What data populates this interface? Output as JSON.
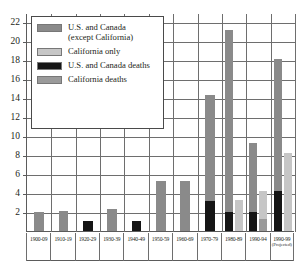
{
  "chart_data": {
    "type": "bar",
    "title": "",
    "subtitle": "",
    "xlabel": "",
    "ylabel": "",
    "ylim": [
      0,
      23
    ],
    "yticks": [
      2,
      4,
      6,
      8,
      10,
      12,
      14,
      16,
      18,
      20,
      22
    ],
    "grid": true,
    "legend_position": "upper-left",
    "categories": [
      "1900-09",
      "1910-19",
      "1920-29",
      "1930-39",
      "1940-49",
      "1950-59",
      "1960-69",
      "1970-79",
      "1980-89",
      "1990-94",
      "1990-99"
    ],
    "category_sublabels": [
      "",
      "",
      "",
      "",
      "",
      "",
      "",
      "",
      "",
      "",
      "(Projected)"
    ],
    "series": [
      {
        "name": "U.S. and Canada (except California)",
        "color": "#8a8a8a",
        "values": [
          2.0,
          2.1,
          0,
          2.3,
          0,
          5.3,
          5.3,
          14.3,
          21.2,
          9.3,
          18.2
        ]
      },
      {
        "name": "California only",
        "color": "#c6c6c6",
        "values": [
          0,
          0,
          0,
          0,
          0,
          0,
          0,
          0,
          3.3,
          4.2,
          8.2
        ]
      },
      {
        "name": "U.S. and Canada deaths",
        "color": "#151515",
        "values": [
          0,
          0,
          1.1,
          0,
          1.1,
          0,
          0,
          3.2,
          2.0,
          2.0,
          4.2
        ]
      },
      {
        "name": "California deaths",
        "color": "#9a9a9a",
        "values": [
          0,
          0,
          0,
          0,
          0,
          0,
          0,
          0,
          0,
          1.3,
          0
        ]
      }
    ]
  },
  "legend": {
    "items": [
      {
        "label": "U.S. and Canada\n(except California)",
        "color": "#8a8a8a"
      },
      {
        "label": "California only",
        "color": "#c6c6c6"
      },
      {
        "label": "U.S. and Canada deaths",
        "color": "#151515"
      },
      {
        "label": "California deaths",
        "color": "#9a9a9a"
      }
    ]
  }
}
